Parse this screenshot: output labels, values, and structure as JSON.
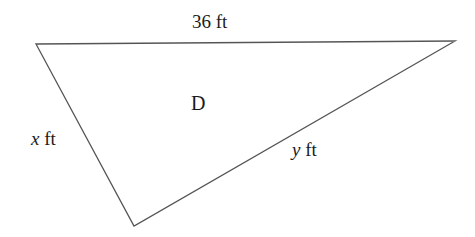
{
  "figure": {
    "type": "triangle-diagram",
    "background_color": "#ffffff",
    "stroke_color": "#555555",
    "text_color": "#1a1a1a",
    "width": 475,
    "height": 237,
    "vertices": {
      "top_left": {
        "x": 36,
        "y": 44
      },
      "right": {
        "x": 455,
        "y": 41
      },
      "bottom": {
        "x": 134,
        "y": 226
      }
    },
    "labels": {
      "top_side": {
        "value": "36",
        "unit": "ft",
        "text": "36 ft",
        "x": 217,
        "y": 24
      },
      "left_side": {
        "variable": "x",
        "unit": "ft",
        "text": "x ft",
        "x": 49,
        "y": 140
      },
      "right_side": {
        "variable": "y",
        "unit": "ft",
        "text": "y ft",
        "x": 311,
        "y": 152
      },
      "region": {
        "text": "D",
        "x": 200,
        "y": 104
      }
    }
  }
}
